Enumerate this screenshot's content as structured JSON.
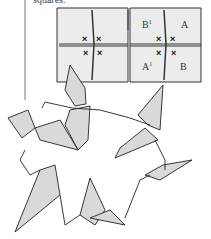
{
  "caption": "squares.",
  "diagram": {
    "panels": [
      {
        "id": "left",
        "marks": [
          "x",
          "x",
          "x",
          "x"
        ]
      },
      {
        "id": "right",
        "labels": {
          "top_left": "B",
          "top_left_sup": "1",
          "top_right": "A",
          "bottom_left": "A",
          "bottom_left_sup": "1",
          "bottom_right": "B"
        },
        "marks": [
          "x",
          "x",
          "x",
          "x"
        ]
      }
    ]
  },
  "illustration": {
    "subject": "ring of origami cranes",
    "count": 6
  },
  "colors": {
    "paper": "#d9d9d9",
    "ink": "#222222",
    "background": "#ffffff"
  }
}
